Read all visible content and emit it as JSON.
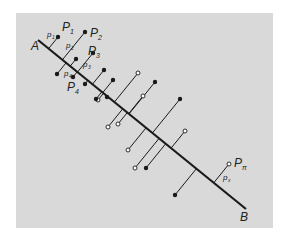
{
  "figure": {
    "colors": {
      "background": "#d9d9d9",
      "ink": "#1a1a1a",
      "open_point_fill": "#ffffff"
    },
    "line": {
      "start_label": "A",
      "end_label": "B"
    },
    "labels": [
      {
        "id": "P1",
        "base": "P",
        "sub": "1"
      },
      {
        "id": "P2",
        "base": "P",
        "sub": "2"
      },
      {
        "id": "P3",
        "base": "P",
        "sub": "3"
      },
      {
        "id": "P4",
        "base": "P",
        "sub": "4"
      },
      {
        "id": "Pn",
        "base": "P",
        "sub": "π"
      },
      {
        "id": "p1",
        "base": "p",
        "sub": "1"
      },
      {
        "id": "p2",
        "base": "p",
        "sub": "2"
      },
      {
        "id": "p3",
        "base": "p",
        "sub": "3"
      },
      {
        "id": "p4",
        "base": "p",
        "sub": "4"
      },
      {
        "id": "pn",
        "base": "p",
        "sub": "x"
      }
    ],
    "points": [
      {
        "id": "P1",
        "side": "above",
        "fill": "filled"
      },
      {
        "id": "P2",
        "side": "above",
        "fill": "filled"
      },
      {
        "id": "P3",
        "side": "above",
        "fill": "filled"
      },
      {
        "id": "P4",
        "side": "below",
        "fill": "filled"
      },
      {
        "id": "q5",
        "side": "above",
        "fill": "filled"
      },
      {
        "id": "q6",
        "side": "below",
        "fill": "filled"
      },
      {
        "id": "q7",
        "side": "above",
        "fill": "filled"
      },
      {
        "id": "q8",
        "side": "below",
        "fill": "filled"
      },
      {
        "id": "q9",
        "side": "below",
        "fill": "open"
      },
      {
        "id": "q10",
        "side": "above",
        "fill": "filled"
      },
      {
        "id": "q11",
        "side": "above",
        "fill": "filled"
      },
      {
        "id": "q12",
        "side": "below",
        "fill": "filled"
      },
      {
        "id": "q13",
        "side": "above",
        "fill": "open"
      },
      {
        "id": "q14",
        "side": "below",
        "fill": "open"
      },
      {
        "id": "q15",
        "side": "above",
        "fill": "open"
      },
      {
        "id": "q16",
        "side": "below",
        "fill": "open"
      },
      {
        "id": "q17",
        "side": "above",
        "fill": "filled"
      },
      {
        "id": "q18",
        "side": "below",
        "fill": "open"
      },
      {
        "id": "q19",
        "side": "above",
        "fill": "filled"
      },
      {
        "id": "q20",
        "side": "below",
        "fill": "open"
      },
      {
        "id": "q21",
        "side": "above",
        "fill": "open"
      },
      {
        "id": "q22",
        "side": "below",
        "fill": "filled"
      },
      {
        "id": "Pn",
        "side": "above",
        "fill": "open"
      },
      {
        "id": "q24",
        "side": "below",
        "fill": "filled"
      }
    ]
  }
}
